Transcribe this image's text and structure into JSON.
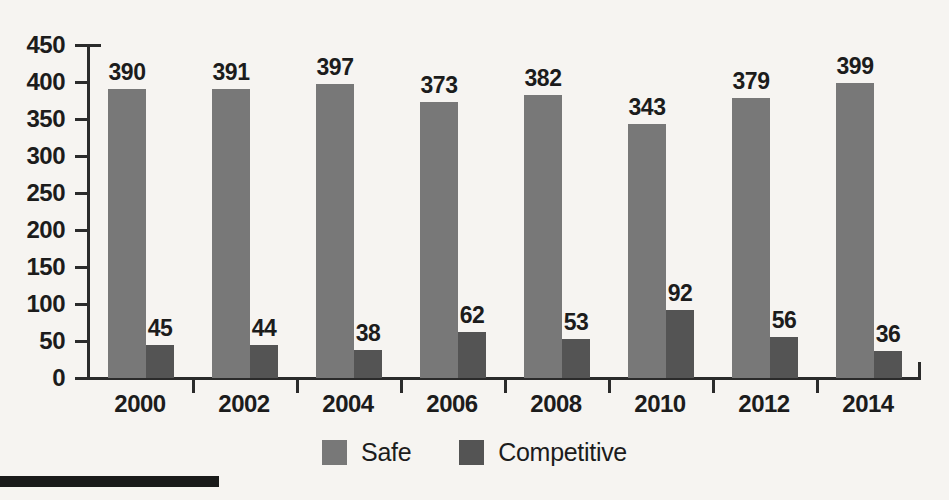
{
  "chart_data": {
    "type": "bar",
    "title": "",
    "subtitle": "",
    "xlabel": "",
    "ylabel": "",
    "categories": [
      "2000",
      "2002",
      "2004",
      "2006",
      "2008",
      "2010",
      "2012",
      "2014"
    ],
    "series": [
      {
        "name": "Safe",
        "color": "#787878",
        "values": [
          390,
          391,
          397,
          373,
          382,
          343,
          379,
          399
        ]
      },
      {
        "name": "Competitive",
        "color": "#545454",
        "values": [
          45,
          44,
          38,
          62,
          53,
          92,
          56,
          36
        ]
      }
    ],
    "ylim": [
      0,
      450
    ],
    "yticks": [
      0,
      50,
      100,
      150,
      200,
      250,
      300,
      350,
      400,
      450
    ],
    "ytick_labels": [
      "0",
      "50",
      "100",
      "150",
      "200",
      "250",
      "300",
      "350",
      "400",
      "450"
    ],
    "grid": false,
    "legend_position": "bottom",
    "data_labels": true
  },
  "legend": {
    "items": [
      {
        "label": "Safe",
        "color": "#787878"
      },
      {
        "label": "Competitive",
        "color": "#545454"
      }
    ]
  },
  "page": {
    "background_color": "#f6f4f1",
    "axis_color": "#2b2b2b",
    "text_color": "#1c1c1c"
  }
}
